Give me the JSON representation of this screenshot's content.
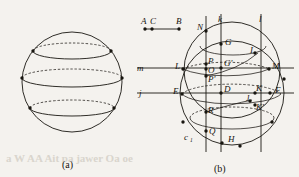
{
  "figure": {
    "type": "geometry-diagram",
    "medium": "scanned-textbook-page",
    "background_color": "#f4f2ee",
    "ink_color": "#191611",
    "captions": [
      {
        "id": "caption-a",
        "text": "(a)",
        "x": 62,
        "y": 166
      },
      {
        "id": "caption-b",
        "text": "(b)",
        "x": 216,
        "y": 170
      }
    ]
  },
  "panel_a": {
    "caption": "(a)",
    "description": "sphere with three horizontal circular cross-sections drawn as ellipses, front arcs solid and rear arcs dashed",
    "sphere": {
      "cx": 72,
      "cy": 82,
      "r": 50
    },
    "cross_sections": [
      {
        "id": "upper-latitude",
        "cy": 51,
        "rx": 39,
        "ry": 8
      },
      {
        "id": "equator-latitude",
        "cy": 78,
        "rx": 50,
        "ry": 9
      },
      {
        "id": "lower-latitude",
        "cy": 108,
        "rx": 42,
        "ry": 8
      }
    ],
    "marked_points": [
      {
        "id": "pt-upper-left",
        "x": 33,
        "y": 51
      },
      {
        "id": "pt-upper-right",
        "x": 111,
        "y": 51
      },
      {
        "id": "pt-equator-left",
        "x": 22,
        "y": 78
      },
      {
        "id": "pt-equator-right",
        "x": 122,
        "y": 78
      },
      {
        "id": "pt-lower-left",
        "x": 30,
        "y": 108
      },
      {
        "id": "pt-lower-right",
        "x": 114,
        "y": 108
      }
    ]
  },
  "panel_b": {
    "caption": "(b)",
    "description": "two overlapping circles cut by two vertical lines k and l and two horizontal lines m and j, with a separate segment A C B above",
    "circle_big": {
      "id": "circle-D",
      "cx": 232,
      "cy": 93,
      "r": 52
    },
    "circle_small": {
      "id": "circle-O",
      "cx": 232,
      "cy": 70,
      "r": 48
    },
    "segment_ACB": {
      "label_a": "A",
      "label_c": "C",
      "label_b": "B",
      "point_a": {
        "x": 145,
        "y": 29
      },
      "point_c": {
        "x": 152,
        "y": 29
      },
      "point_b": {
        "x": 179,
        "y": 29
      }
    },
    "vertical_lines": [
      {
        "label": "k",
        "x": 221,
        "y_top": 14,
        "y_bottom": 152
      },
      {
        "label": "l",
        "x": 261,
        "y_top": 14,
        "y_bottom": 152
      }
    ],
    "unlabeled_vertical": {
      "x": 206,
      "y_top": 16,
      "y_bottom": 152
    },
    "horizontal_lines": [
      {
        "label": "m",
        "y": 68,
        "x_left": 137,
        "x_right": 294
      },
      {
        "label": "j",
        "y": 93,
        "x_left": 137,
        "x_right": 294
      }
    ],
    "dashed_chords": [
      {
        "id": "chord-L-M",
        "y": 64
      },
      {
        "id": "chord-E-F",
        "y": 90
      },
      {
        "id": "chord-R",
        "y": 112
      }
    ],
    "labeled_points": [
      {
        "label": "N",
        "x": 200,
        "y": 27,
        "dot_x": 206,
        "dot_y": 31
      },
      {
        "label": "G",
        "x": 228,
        "y": 42,
        "dot_x": 221,
        "dot_y": 44
      },
      {
        "label": "I",
        "x": 251,
        "y": 50,
        "dot_x": 255,
        "dot_y": 53
      },
      {
        "label": "L",
        "x": 176,
        "y": 66,
        "dot_x": 183,
        "dot_y": 69
      },
      {
        "label": "P",
        "x": 209,
        "y": 63,
        "dot_x": 206,
        "dot_y": 64
      },
      {
        "label": "G'",
        "x": 226,
        "y": 65,
        "dot_x": 221,
        "dot_y": 68
      },
      {
        "label": "M",
        "x": 275,
        "y": 67,
        "dot_x": 269,
        "dot_y": 69
      },
      {
        "label": "O",
        "x": 209,
        "y": 71,
        "dot_x": 206,
        "dot_y": 69
      },
      {
        "label": "P'",
        "x": 209,
        "y": 80,
        "dot_x": 206,
        "dot_y": 76
      },
      {
        "label": "E",
        "x": 174,
        "y": 91,
        "dot_x": 182,
        "dot_y": 94
      },
      {
        "label": "D",
        "x": 226,
        "y": 91,
        "dot_x": 221,
        "dot_y": 93
      },
      {
        "label": "K",
        "x": 258,
        "y": 91,
        "dot_x": 255,
        "dot_y": 93
      },
      {
        "label": "F",
        "x": 277,
        "y": 91,
        "dot_x": 270,
        "dot_y": 93
      },
      {
        "label": "J",
        "x": 248,
        "y": 99,
        "dot_x": 250,
        "dot_y": 101
      },
      {
        "label": "K'",
        "x": 258,
        "y": 108,
        "dot_x": 255,
        "dot_y": 105
      },
      {
        "label": "R",
        "x": 210,
        "y": 111,
        "dot_x": 206,
        "dot_y": 112
      },
      {
        "label": "Q",
        "x": 211,
        "y": 132,
        "dot_x": 206,
        "dot_y": 131
      },
      {
        "label": "H",
        "x": 230,
        "y": 140,
        "dot_x": 222,
        "dot_y": 143
      },
      {
        "label": "c",
        "sub": "1",
        "x": 186,
        "y": 138
      }
    ],
    "unlabeled_dots": [
      {
        "x": 183,
        "y": 122
      },
      {
        "x": 240,
        "y": 146
      },
      {
        "x": 272,
        "y": 122
      },
      {
        "x": 177,
        "y": 108
      },
      {
        "x": 284,
        "y": 79
      }
    ]
  },
  "ghost_text": [
    {
      "text": "a W AA Ait pa jawer Oa oe",
      "x": 6,
      "y": 155
    },
    {
      "text": "—",
      "x": 258,
      "y": 148
    }
  ]
}
